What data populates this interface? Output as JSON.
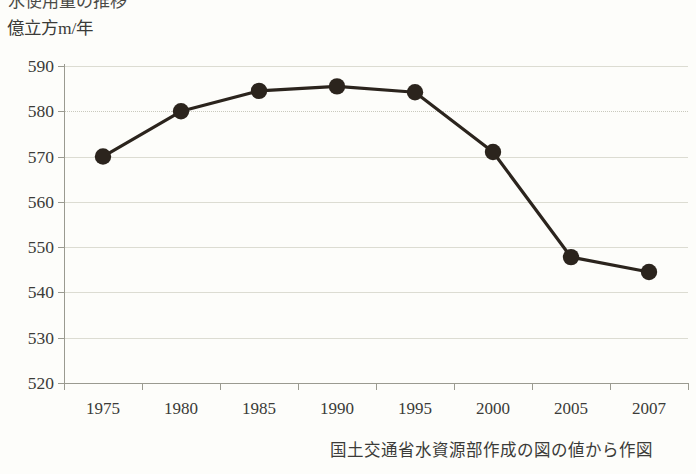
{
  "top_clipped_title": "水使用量の推移",
  "axis": {
    "y_unit_label": "億立方m/年",
    "y_ticks": [
      590,
      580,
      570,
      560,
      550,
      540,
      530,
      520
    ],
    "x_ticks": [
      "1975",
      "1980",
      "1985",
      "1990",
      "1995",
      "2000",
      "2005",
      "2007"
    ]
  },
  "caption": "国土交通省水資源部作成の図の値から作図",
  "colors": {
    "marker": "#2b241d",
    "line": "#2b241d",
    "grid": "#dcdcd2",
    "axis": "#9a9a90",
    "text": "#3b3b38",
    "background": "#fdfdfa"
  },
  "chart_data": {
    "type": "line",
    "title": "水使用量の推移",
    "xlabel": "",
    "ylabel": "億立方m/年",
    "categories": [
      "1975",
      "1980",
      "1985",
      "1990",
      "1995",
      "2000",
      "2005",
      "2007"
    ],
    "values": [
      570.0,
      580.0,
      584.5,
      585.5,
      584.2,
      571.0,
      547.8,
      544.5
    ],
    "ylim": [
      520,
      590
    ],
    "yticks": [
      520,
      530,
      540,
      550,
      560,
      570,
      580,
      590
    ],
    "grid": true,
    "legend": false,
    "series": [
      {
        "name": "水使用量",
        "values": [
          570.0,
          580.0,
          584.5,
          585.5,
          584.2,
          571.0,
          547.8,
          544.5
        ]
      }
    ],
    "annotations": [
      "国土交通省水資源部作成の図の値から作図"
    ]
  }
}
